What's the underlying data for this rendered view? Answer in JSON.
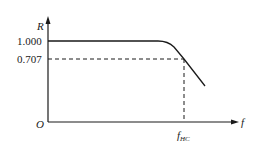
{
  "diagram": {
    "type": "frequency-response-curve",
    "axes": {
      "y_label": "R",
      "x_label": "f",
      "origin_label": "O"
    },
    "y_ticks": [
      {
        "value": "1.000",
        "label": "1.000"
      },
      {
        "value": "0.707",
        "label": "0.707"
      }
    ],
    "x_marker": {
      "main": "f",
      "subscript": "HC"
    },
    "curve": {
      "description": "Flat at R=1.000 then rolls off, crossing R=0.707 at f_HC",
      "points_px": [
        [
          48,
          41
        ],
        [
          160,
          41
        ],
        [
          170,
          44
        ],
        [
          184,
          59
        ],
        [
          205,
          85
        ]
      ]
    },
    "colors": {
      "line": "#1a1a1a",
      "background": "#ffffff"
    }
  }
}
